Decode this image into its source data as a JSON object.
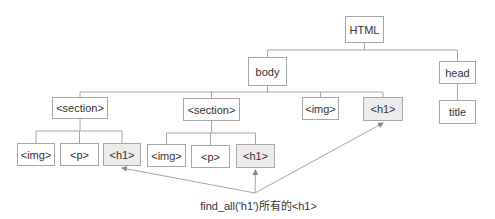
{
  "diagram": {
    "nodes": [
      {
        "id": "html",
        "label": "HTML",
        "highlighted": false
      },
      {
        "id": "body",
        "label": "body",
        "highlighted": false
      },
      {
        "id": "head",
        "label": "head",
        "highlighted": false
      },
      {
        "id": "section1",
        "label": "<section>",
        "highlighted": false
      },
      {
        "id": "section2",
        "label": "<section>",
        "highlighted": false
      },
      {
        "id": "img3",
        "label": "<img>",
        "highlighted": false
      },
      {
        "id": "h1c",
        "label": "<h1>",
        "highlighted": true
      },
      {
        "id": "title",
        "label": "title",
        "highlighted": false
      },
      {
        "id": "img1",
        "label": "<img>",
        "highlighted": false
      },
      {
        "id": "p1",
        "label": "<p>",
        "highlighted": false
      },
      {
        "id": "h1a",
        "label": "<h1>",
        "highlighted": true
      },
      {
        "id": "img2",
        "label": "<img>",
        "highlighted": false
      },
      {
        "id": "p2",
        "label": "<p>",
        "highlighted": false
      },
      {
        "id": "h1b",
        "label": "<h1>",
        "highlighted": true
      }
    ],
    "edges": [
      [
        "html",
        "body"
      ],
      [
        "html",
        "head"
      ],
      [
        "body",
        "section1"
      ],
      [
        "body",
        "section2"
      ],
      [
        "body",
        "img3"
      ],
      [
        "body",
        "h1c"
      ],
      [
        "head",
        "title"
      ],
      [
        "section1",
        "img1"
      ],
      [
        "section1",
        "p1"
      ],
      [
        "section1",
        "h1a"
      ],
      [
        "section2",
        "img2"
      ],
      [
        "section2",
        "p2"
      ],
      [
        "section2",
        "h1b"
      ]
    ],
    "arrows_to": [
      "h1a",
      "h1b",
      "h1c"
    ],
    "caption": "find_all('h1')所有的<h1>",
    "colors": {
      "border": "#a6a6a6",
      "highlight": "#ececec",
      "line": "#a6a6a6",
      "text": "#333333"
    }
  }
}
